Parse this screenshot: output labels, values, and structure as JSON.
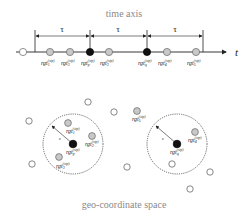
{
  "titles": {
    "top": "time axis",
    "bottom": "geo-coordinate space"
  },
  "time_axis": {
    "axis_label": "t",
    "interval_label": "τ",
    "intervals": [
      "τ",
      "τ",
      "τ"
    ],
    "points": [
      {
        "type": "open",
        "label": ""
      },
      {
        "type": "gray",
        "label": "rgt",
        "sub": "1",
        "sup": "(stp)"
      },
      {
        "type": "gray",
        "label": "rgt",
        "sub": "2",
        "sup": "(stp)"
      },
      {
        "type": "black",
        "label": "rgt",
        "sub": "p",
        "sup": "(stp)"
      },
      {
        "type": "gray",
        "label": "rgt",
        "sub": "3",
        "sup": "(stp)"
      },
      {
        "type": "black",
        "label": "rgt",
        "sub": "q",
        "sup": "(stp)"
      },
      {
        "type": "gray",
        "label": "rgt",
        "sub": "4",
        "sup": "(stp)"
      },
      {
        "type": "gray",
        "label": "rgt",
        "sub": "5",
        "sup": "(stp)"
      }
    ]
  },
  "geo_space": {
    "radius_label": "ε",
    "clusters": [
      {
        "center": {
          "label": "rgt",
          "sub": "p",
          "sup": "(stp)"
        },
        "members": [
          {
            "label": "rgt",
            "sub": "1",
            "sup": "(stp)"
          },
          {
            "label": "rgt",
            "sub": "2",
            "sup": "(stp)"
          },
          {
            "label": "rgt",
            "sub": "3",
            "sup": "(stp)"
          }
        ]
      },
      {
        "center": {
          "label": "rgt",
          "sub": "q",
          "sup": "(stp)"
        },
        "members": [
          {
            "label": "rgt",
            "sub": "4",
            "sup": "(stp)"
          }
        ]
      }
    ],
    "outside_labeled": [
      {
        "label": "rgt",
        "sub": "5",
        "sup": "(stp)"
      }
    ]
  },
  "colors": {
    "line": "#222222",
    "gray_fill": "#c8c8c8",
    "black_fill": "#111111",
    "title": "#8a8a8a"
  }
}
